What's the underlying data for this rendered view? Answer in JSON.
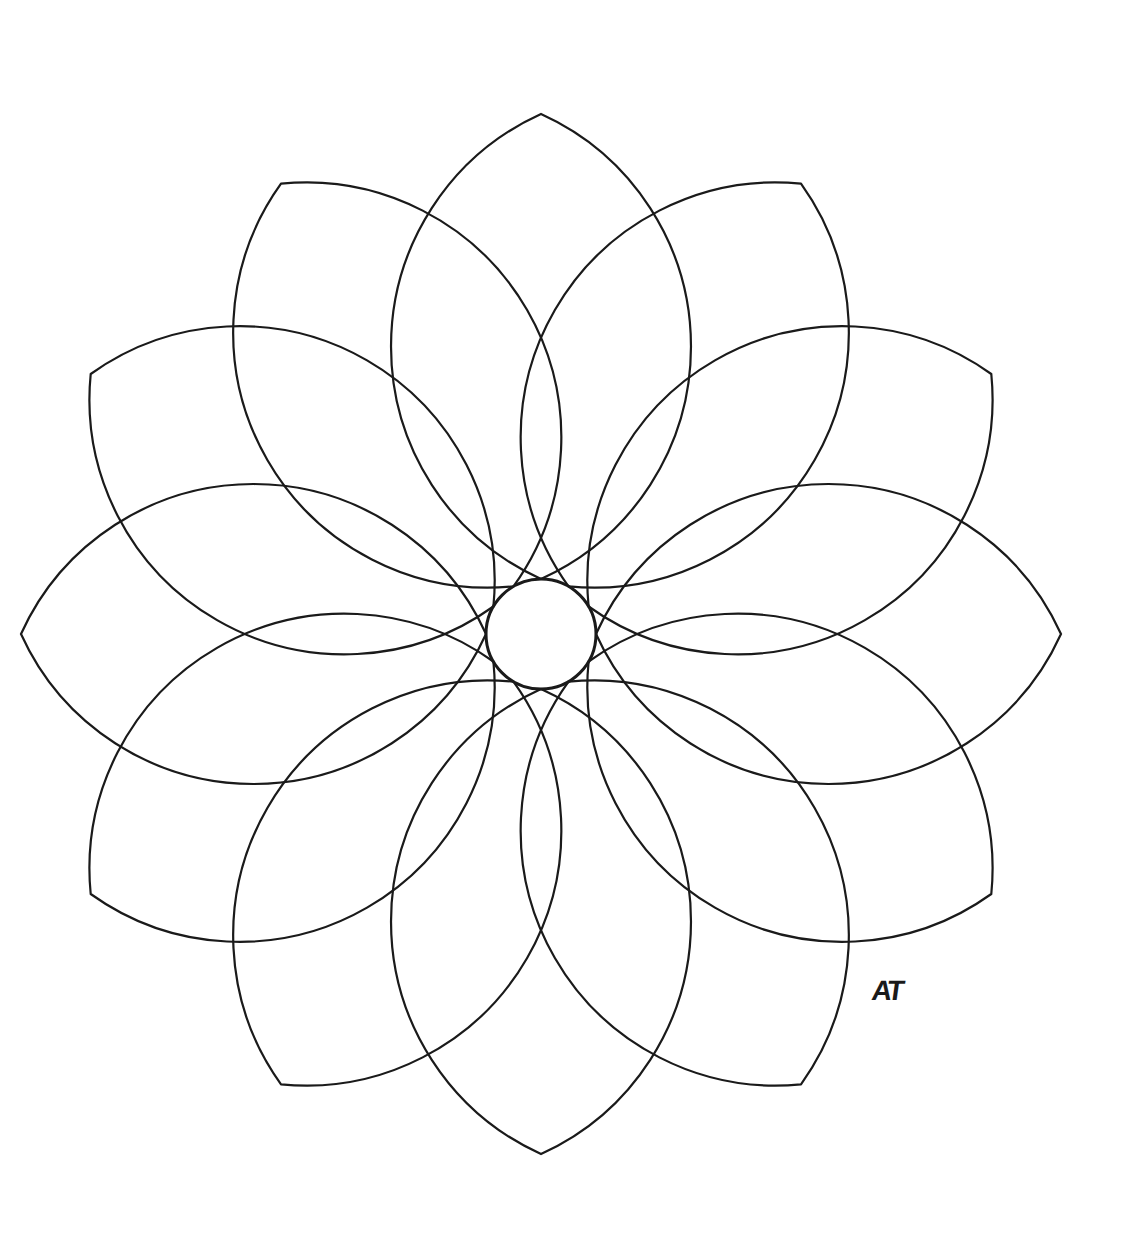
{
  "artwork": {
    "type": "line-art mandala",
    "petal_count": 12,
    "center": [
      541,
      634
    ],
    "center_circle_radius": 55,
    "outer_radius": 520,
    "stroke_color": "#1a1a1a",
    "background": "#ffffff",
    "signature": "AT"
  }
}
